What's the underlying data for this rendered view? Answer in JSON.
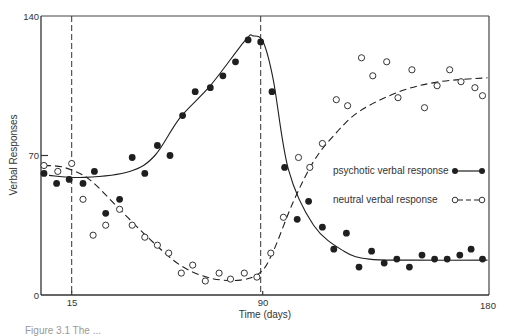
{
  "chart_data": {
    "type": "scatter",
    "title": "",
    "xlabel": "Time (days)",
    "ylabel": "Verbal Responses",
    "xlim": [
      3,
      180
    ],
    "ylim": [
      0,
      140
    ],
    "x_ticks": [
      15,
      90,
      180
    ],
    "y_ticks": [
      0,
      70,
      140
    ],
    "grid": false,
    "legend_position": "right-middle inside plot",
    "vertical_reference_lines": [
      15,
      90
    ],
    "series": [
      {
        "name": "psychotic verbal response",
        "marker": "filled-circle",
        "line": "solid",
        "points": [
          [
            4,
            61
          ],
          [
            9,
            56
          ],
          [
            14,
            58
          ],
          [
            19.5,
            56
          ],
          [
            24,
            62
          ],
          [
            28.5,
            41
          ],
          [
            34,
            48
          ],
          [
            39,
            69
          ],
          [
            44,
            61
          ],
          [
            49,
            75
          ],
          [
            54,
            70
          ],
          [
            59,
            90
          ],
          [
            64,
            102
          ],
          [
            70,
            104
          ],
          [
            75,
            110
          ],
          [
            80,
            117
          ],
          [
            85,
            128
          ],
          [
            90,
            127
          ],
          [
            94.5,
            102
          ],
          [
            99.5,
            64
          ],
          [
            104.5,
            38
          ],
          [
            109,
            47
          ],
          [
            114.5,
            34
          ],
          [
            119,
            23
          ],
          [
            124,
            31
          ],
          [
            129,
            14
          ],
          [
            134,
            22
          ],
          [
            139,
            16
          ],
          [
            144,
            18
          ],
          [
            149,
            14
          ],
          [
            154,
            20
          ],
          [
            159,
            18
          ],
          [
            164,
            18
          ],
          [
            169,
            20
          ],
          [
            173.5,
            23
          ],
          [
            178,
            18
          ]
        ],
        "fit_curve": [
          [
            6,
            60
          ],
          [
            20,
            59
          ],
          [
            38,
            62
          ],
          [
            48,
            70
          ],
          [
            58,
            89
          ],
          [
            70,
            105
          ],
          [
            84,
            128
          ],
          [
            87,
            130
          ],
          [
            91,
            127
          ],
          [
            95,
            108
          ],
          [
            101,
            63
          ],
          [
            111,
            35
          ],
          [
            123,
            22
          ],
          [
            133,
            18
          ],
          [
            150,
            17.5
          ],
          [
            180,
            17.5
          ]
        ]
      },
      {
        "name": "neutral verbal response",
        "marker": "open-circle",
        "line": "dashed",
        "points": [
          [
            4,
            65
          ],
          [
            9.5,
            62
          ],
          [
            15,
            66
          ],
          [
            19.5,
            48
          ],
          [
            23.5,
            30
          ],
          [
            28.5,
            35
          ],
          [
            34,
            43
          ],
          [
            39,
            35
          ],
          [
            44,
            29
          ],
          [
            49,
            25
          ],
          [
            53.5,
            21
          ],
          [
            58.5,
            11
          ],
          [
            63,
            15
          ],
          [
            68,
            7
          ],
          [
            73.5,
            11
          ],
          [
            78,
            8
          ],
          [
            83.5,
            11
          ],
          [
            88.5,
            9
          ],
          [
            94,
            21
          ],
          [
            99,
            39
          ],
          [
            105,
            69
          ],
          [
            109.5,
            64
          ],
          [
            114.5,
            76
          ],
          [
            120,
            98
          ],
          [
            124.5,
            95
          ],
          [
            130,
            119
          ],
          [
            134.5,
            110
          ],
          [
            140,
            117
          ],
          [
            144.5,
            99
          ],
          [
            150,
            113
          ],
          [
            155,
            94
          ],
          [
            160,
            105
          ],
          [
            165,
            113
          ],
          [
            169.5,
            107
          ],
          [
            175,
            104
          ],
          [
            178,
            100
          ]
        ],
        "fit_curve": [
          [
            4,
            65
          ],
          [
            12,
            64
          ],
          [
            22,
            58
          ],
          [
            34,
            43
          ],
          [
            46,
            28
          ],
          [
            58,
            15
          ],
          [
            70,
            8.5
          ],
          [
            82,
            7.5
          ],
          [
            90,
            11.5
          ],
          [
            95,
            22
          ],
          [
            103,
            47
          ],
          [
            111,
            67
          ],
          [
            119,
            80
          ],
          [
            129,
            92
          ],
          [
            145,
            102
          ],
          [
            161,
            107
          ],
          [
            180,
            109
          ]
        ]
      }
    ]
  },
  "axes": {
    "y_tick_labels": [
      "140",
      "70",
      "0"
    ],
    "x_tick_labels": [
      "15",
      "90",
      "180"
    ],
    "xlabel": "Time (days)",
    "ylabel": "Verbal Responses"
  },
  "legend": {
    "items": [
      {
        "label": "psychotic verbal response",
        "marker": "filled-circle",
        "line": "solid"
      },
      {
        "label": "neutral verbal response",
        "marker": "open-circle",
        "line": "dashed"
      }
    ]
  },
  "caption": {
    "text": "Figure 3.1  The ..."
  },
  "colors": {
    "ink": "#1f1f1f",
    "axis": "#333333",
    "background": "#ffffff"
  }
}
